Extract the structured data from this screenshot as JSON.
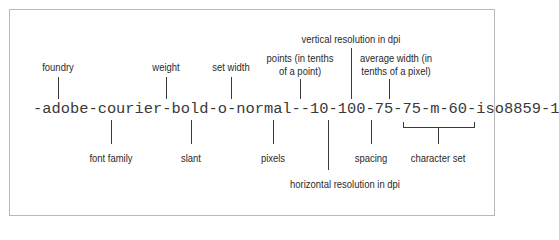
{
  "diagram": {
    "font_name": "-adobe-courier-bold-o-normal--10-100-75-75-m-60-iso8859-1",
    "labels_above": {
      "foundry": "foundry",
      "weight": "weight",
      "set_width": "set width",
      "points_line1": "points (in tenths",
      "points_line2": "of a point)",
      "vertical": "vertical resolution in dpi",
      "avg_width_line1": "average width (in",
      "avg_width_line2": "tenths of a pixel)"
    },
    "labels_below": {
      "font_family": "font family",
      "slant": "slant",
      "pixels": "pixels",
      "horizontal": "horizontal resolution in dpi",
      "spacing": "spacing",
      "character_set": "character set"
    }
  }
}
